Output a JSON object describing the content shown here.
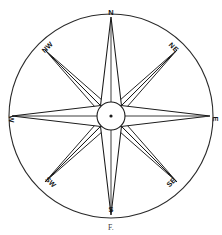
{
  "figure": {
    "kind": "compass-rose",
    "caption": "F.",
    "background_color": "#ffffff",
    "line_color": "#1a1a1a",
    "fill_color": "#ffffff"
  },
  "geometry": {
    "center_x": 111,
    "center_y": 116,
    "outer_radius": 102,
    "hub_radius": 14,
    "major_ray_length": 99,
    "minor_ray_length": 93,
    "major_ray_half_width": 11,
    "minor_ray_half_width": 6
  },
  "compass": {
    "points": [
      {
        "label": "N",
        "abbr": "N",
        "bearing": 0,
        "kind": "cardinal",
        "label_rotation": 0
      },
      {
        "label": "NE",
        "abbr": "NE",
        "bearing": 45,
        "kind": "intercardinal",
        "label_rotation": 45
      },
      {
        "label": "E",
        "abbr": "E",
        "bearing": 90,
        "kind": "cardinal",
        "label_rotation": 90
      },
      {
        "label": "SE",
        "abbr": "SE",
        "bearing": 135,
        "kind": "intercardinal",
        "label_rotation": 135
      },
      {
        "label": "S",
        "abbr": "S",
        "bearing": 180,
        "kind": "cardinal",
        "label_rotation": 0
      },
      {
        "label": "SW",
        "abbr": "SW",
        "bearing": 225,
        "kind": "intercardinal",
        "label_rotation": 45
      },
      {
        "label": "W",
        "abbr": "W",
        "bearing": 270,
        "kind": "cardinal",
        "label_rotation": 90
      },
      {
        "label": "NW",
        "abbr": "NW",
        "bearing": 315,
        "kind": "intercardinal",
        "label_rotation": 135
      }
    ]
  }
}
